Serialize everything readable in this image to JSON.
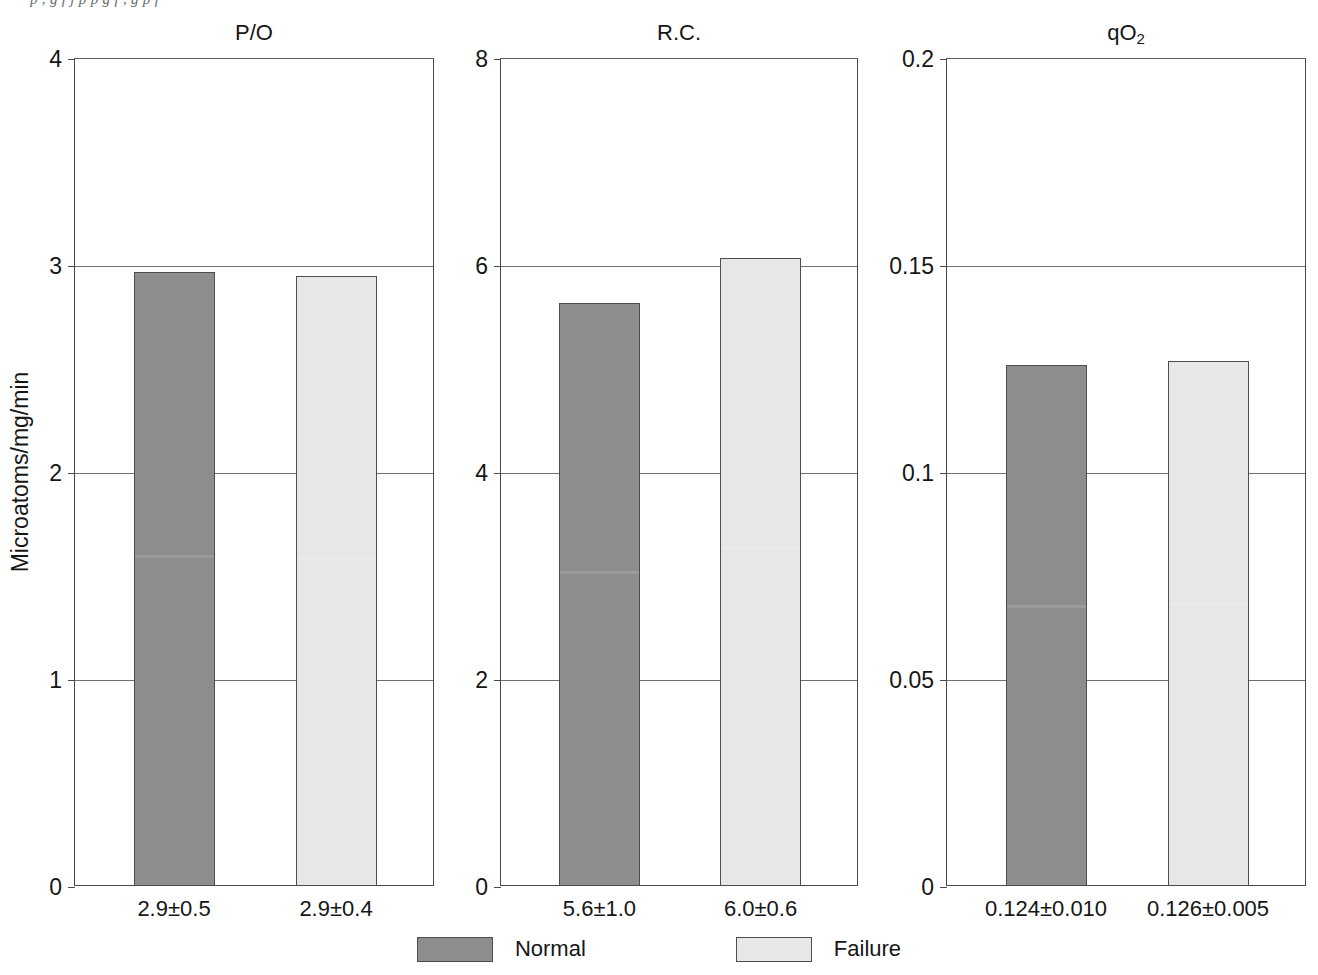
{
  "clipped_caption": "p   ,   g   f   j   p   p g f   ,   g   p   f",
  "ylabel": "Microatoms/mg/min",
  "legend": {
    "items": [
      {
        "label": "Normal",
        "color": "#8d8d8d",
        "key": "normal"
      },
      {
        "label": "Failure",
        "color": "#e7e7e7",
        "key": "failure"
      }
    ]
  },
  "panels": [
    {
      "id": "po",
      "title": "P/O",
      "title_sub": "",
      "ylim": [
        0,
        4
      ],
      "yticks": [
        "0",
        "1",
        "2",
        "3",
        "4"
      ],
      "ytick_values": [
        0,
        1,
        2,
        3,
        4
      ],
      "bars": [
        {
          "series": "Normal",
          "value": 2.96,
          "label": "2.9±0.5"
        },
        {
          "series": "Failure",
          "value": 2.94,
          "label": "2.9±0.4"
        }
      ]
    },
    {
      "id": "rc",
      "title": "R.C.",
      "title_sub": "",
      "ylim": [
        0,
        8
      ],
      "yticks": [
        "0",
        "2",
        "4",
        "6",
        "8"
      ],
      "ytick_values": [
        0,
        2,
        4,
        6,
        8
      ],
      "bars": [
        {
          "series": "Normal",
          "value": 5.62,
          "label": "5.6±1.0"
        },
        {
          "series": "Failure",
          "value": 6.06,
          "label": "6.0±0.6"
        }
      ]
    },
    {
      "id": "qo2",
      "title": "qO",
      "title_sub": "2",
      "ylim": [
        0,
        0.2
      ],
      "yticks": [
        "0",
        "0.05",
        "0.1",
        "0.15",
        "0.2"
      ],
      "ytick_values": [
        0,
        0.05,
        0.1,
        0.15,
        0.2
      ],
      "bars": [
        {
          "series": "Normal",
          "value": 0.1255,
          "label": "0.124±0.010"
        },
        {
          "series": "Failure",
          "value": 0.1265,
          "label": "0.126±0.005"
        }
      ]
    }
  ],
  "chart_data": {
    "type": "bar",
    "title": "",
    "subplots": [
      {
        "title": "P/O",
        "ylabel": "Microatoms/mg/min",
        "ylim": [
          0,
          4
        ],
        "yticks": [
          0,
          1,
          2,
          3,
          4
        ],
        "categories": [
          "Normal",
          "Failure"
        ],
        "values": [
          2.9,
          2.9
        ],
        "value_labels": [
          "2.9±0.5",
          "2.9±0.4"
        ],
        "errors": [
          0.5,
          0.4
        ],
        "grid": true
      },
      {
        "title": "R.C.",
        "ylabel": "",
        "ylim": [
          0,
          8
        ],
        "yticks": [
          0,
          2,
          4,
          6,
          8
        ],
        "categories": [
          "Normal",
          "Failure"
        ],
        "values": [
          5.6,
          6.0
        ],
        "value_labels": [
          "5.6±1.0",
          "6.0±0.6"
        ],
        "errors": [
          1.0,
          0.6
        ],
        "grid": true
      },
      {
        "title": "qO2",
        "ylabel": "",
        "ylim": [
          0,
          0.2
        ],
        "yticks": [
          0,
          0.05,
          0.1,
          0.15,
          0.2
        ],
        "categories": [
          "Normal",
          "Failure"
        ],
        "values": [
          0.124,
          0.126
        ],
        "value_labels": [
          "0.124±0.010",
          "0.126±0.005"
        ],
        "errors": [
          0.01,
          0.005
        ],
        "grid": true
      }
    ],
    "series": [
      {
        "name": "Normal",
        "color": "#8d8d8d",
        "values": [
          2.9,
          5.6,
          0.124
        ]
      },
      {
        "name": "Failure",
        "color": "#e7e7e7",
        "values": [
          2.9,
          6.0,
          0.126
        ]
      }
    ],
    "categories": [
      "P/O",
      "R.C.",
      "qO2"
    ],
    "legend": [
      "Normal",
      "Failure"
    ],
    "legend_position": "bottom",
    "xlabel": "",
    "ylabel": "Microatoms/mg/min"
  }
}
